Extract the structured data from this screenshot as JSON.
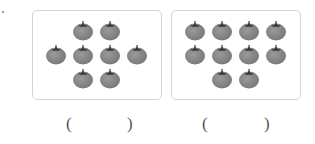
{
  "problem": {
    "groups": [
      {
        "name": "group-1",
        "count": 8,
        "rows": [
          2,
          4,
          2
        ],
        "answer": ""
      },
      {
        "name": "group-2",
        "count": 10,
        "rows": [
          4,
          4,
          2
        ],
        "answer": ""
      }
    ],
    "paren_open": "(",
    "paren_close": ")",
    "icon": "tomato-icon"
  },
  "colors": {
    "tomato": "#777777",
    "border": "#d4d4d4"
  }
}
